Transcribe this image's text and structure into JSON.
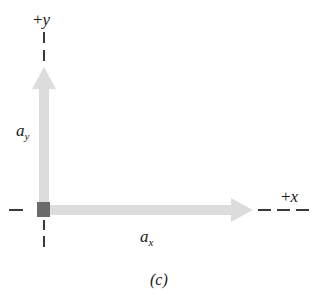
{
  "figure": {
    "caption": "(c)",
    "background_color": "#ffffff"
  },
  "colors": {
    "vector_fill": "#dcdcdc",
    "origin_marker": "#6b6b6b",
    "axis_dash": "#3a3a3a",
    "text": "#1a1a1a"
  },
  "axes": {
    "y_axis": {
      "label_sign": "+",
      "label_letter": "y",
      "label_full": "+y",
      "direction": "up",
      "dash_count_beyond_arrow": 2,
      "dash_count_below_origin": 2
    },
    "x_axis": {
      "label_sign": "+",
      "label_letter": "x",
      "label_full": "+x",
      "direction": "right",
      "dash_count_beyond_arrow": 3,
      "dash_count_left_of_origin": 1
    }
  },
  "vectors": [
    {
      "name": "a_y",
      "label_base": "a",
      "label_sub": "y",
      "orientation": "vertical",
      "points": "up",
      "length_px": 140
    },
    {
      "name": "a_x",
      "label_base": "a",
      "label_sub": "x",
      "orientation": "horizontal",
      "points": "right",
      "length_px": 207
    }
  ],
  "origin": {
    "marker_shape": "square",
    "x_px": 45,
    "y_px": 210
  }
}
